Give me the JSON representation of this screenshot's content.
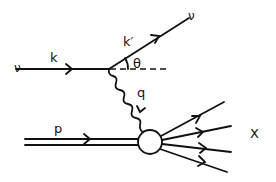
{
  "diagram": {
    "labels": {
      "incoming_lepton": "ν",
      "incoming_momentum": "k",
      "outgoing_lepton": "ν",
      "outgoing_momentum": "k′",
      "scattering_angle": "θ",
      "exchanged_boson_momentum": "q",
      "proton_momentum": "p",
      "hadronic_final_state": "X"
    },
    "elements": [
      {
        "id": "incoming-neutrino",
        "type": "fermion-line",
        "from": "left",
        "to": "vertex",
        "label": "k"
      },
      {
        "id": "outgoing-neutrino",
        "type": "fermion-line",
        "from": "vertex",
        "to": "upper-right",
        "label": "k′"
      },
      {
        "id": "reference-axis",
        "type": "dashed-line",
        "from": "vertex",
        "to": "right"
      },
      {
        "id": "angle-arc",
        "type": "arc",
        "label": "θ"
      },
      {
        "id": "exchange-boson",
        "type": "wavy-line",
        "from": "vertex",
        "to": "hadronic-blob",
        "label": "q"
      },
      {
        "id": "proton",
        "type": "double-line",
        "from": "left",
        "to": "hadronic-blob",
        "label": "p"
      },
      {
        "id": "hadronic-blob",
        "type": "circle"
      },
      {
        "id": "final-state-hadrons",
        "type": "fermion-lines",
        "count": 4,
        "label": "X"
      }
    ]
  }
}
